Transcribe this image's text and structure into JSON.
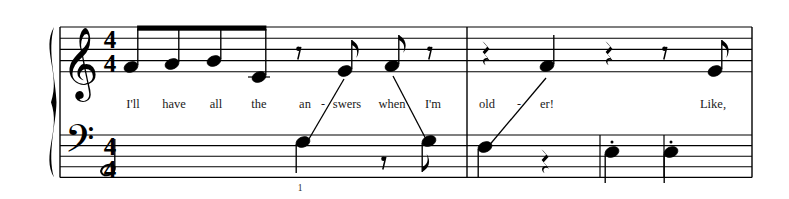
{
  "document": {
    "type": "music-score",
    "system": "piano-grand-staff",
    "background_color": "#ffffff",
    "ink_color": "#000000",
    "measure_numbers": [
      {
        "label": "1",
        "x": 300,
        "y": 183
      }
    ]
  },
  "staves": {
    "treble": {
      "clef": "treble-clef",
      "clef_glyph": "𝄞",
      "time_signature": {
        "numerator": "4",
        "denominator": "4"
      },
      "top_line_y": 27,
      "line_spacing": 11.2,
      "left_x": 60,
      "right_x": 752
    },
    "bass": {
      "clef": "bass-clef",
      "clef_glyph": "𝄢",
      "time_signature": {
        "numerator": "4",
        "denominator": "4"
      },
      "top_line_y": 135,
      "line_spacing": 10.6,
      "left_x": 60,
      "right_x": 752
    }
  },
  "barlines": [
    {
      "name": "system-start",
      "x": 60
    },
    {
      "name": "measure-1-end",
      "x": 467
    },
    {
      "name": "measure-2-inner-a",
      "x": 600
    },
    {
      "name": "measure-2-inner-b",
      "x": 664
    },
    {
      "name": "system-end",
      "x": 752
    }
  ],
  "lyrics": [
    {
      "text": "I'll",
      "x": 133,
      "y": 98
    },
    {
      "text": "have",
      "x": 174,
      "y": 98
    },
    {
      "text": "all",
      "x": 216,
      "y": 98
    },
    {
      "text": "the",
      "x": 259,
      "y": 98
    },
    {
      "text": "an",
      "x": 305,
      "y": 98
    },
    {
      "text": "-",
      "x": 323,
      "y": 98,
      "hyphen": true
    },
    {
      "text": "swers",
      "x": 347,
      "y": 98
    },
    {
      "text": "when",
      "x": 392,
      "y": 98
    },
    {
      "text": "I'm",
      "x": 433,
      "y": 98
    },
    {
      "text": "old",
      "x": 487,
      "y": 98
    },
    {
      "text": "-",
      "x": 519,
      "y": 98,
      "hyphen": true
    },
    {
      "text": "er!",
      "x": 547,
      "y": 98
    },
    {
      "text": "Like,",
      "x": 713,
      "y": 98
    }
  ],
  "notation": {
    "treble_notes": [
      {
        "name": "eighth-note-beamed-1",
        "x": 131,
        "y": 67,
        "stem": "up",
        "beamed": true
      },
      {
        "name": "eighth-note-beamed-2",
        "x": 172,
        "y": 64,
        "stem": "up",
        "beamed": true
      },
      {
        "name": "eighth-note-beamed-3",
        "x": 214,
        "y": 61,
        "stem": "up",
        "beamed": true
      },
      {
        "name": "eighth-note-beamed-4",
        "x": 259,
        "y": 77,
        "stem": "up",
        "beamed": true,
        "ledger": true
      },
      {
        "name": "eighth-note-flagged-1",
        "x": 345,
        "y": 71,
        "stem": "up",
        "flag": true
      },
      {
        "name": "eighth-note-flagged-2",
        "x": 392,
        "y": 66,
        "stem": "up",
        "flag": true
      },
      {
        "name": "quarter-note-1",
        "x": 547,
        "y": 66,
        "stem": "up"
      },
      {
        "name": "eighth-note-flagged-3",
        "x": 715,
        "y": 71,
        "stem": "up",
        "flag": true
      }
    ],
    "treble_rests": [
      {
        "name": "eighth-rest-1",
        "x": 300,
        "y": 50
      },
      {
        "name": "eighth-rest-2",
        "x": 431,
        "y": 50
      },
      {
        "name": "quarter-rest-1",
        "x": 487,
        "y": 49
      },
      {
        "name": "quarter-rest-2",
        "x": 610,
        "y": 49
      },
      {
        "name": "eighth-rest-3",
        "x": 666,
        "y": 50
      }
    ],
    "bass_notes": [
      {
        "name": "half-note-1",
        "x": 108,
        "y": 170,
        "stem": "up",
        "open": true
      },
      {
        "name": "quarter-note-2",
        "x": 303,
        "y": 142,
        "stem": "down"
      },
      {
        "name": "eighth-note-flagged-4",
        "x": 429,
        "y": 141,
        "stem": "down",
        "flag": true
      },
      {
        "name": "quarter-note-3",
        "x": 485,
        "y": 147,
        "stem": "down"
      },
      {
        "name": "quarter-note-staccato-1",
        "x": 612,
        "y": 152,
        "stem": "down",
        "staccato": true
      },
      {
        "name": "quarter-note-staccato-2",
        "x": 671,
        "y": 152,
        "stem": "down",
        "staccato": true
      }
    ],
    "bass_rests": [
      {
        "name": "eighth-rest-4",
        "x": 385,
        "y": 160
      },
      {
        "name": "quarter-rest-3",
        "x": 546,
        "y": 157
      }
    ],
    "cross_staff_lines": [
      {
        "name": "stem-connector-answers",
        "x1": 306,
        "y1": 144,
        "x2": 344,
        "y2": 79
      },
      {
        "name": "stem-connector-im",
        "x1": 393,
        "y1": 76,
        "x2": 428,
        "y2": 143
      },
      {
        "name": "stem-connector-older",
        "x1": 487,
        "y1": 148,
        "x2": 546,
        "y2": 78
      }
    ]
  }
}
